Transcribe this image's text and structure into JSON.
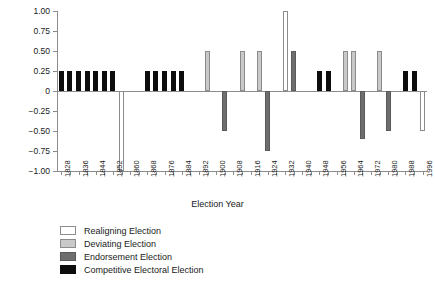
{
  "chart_data": {
    "type": "bar",
    "title": "",
    "xlabel": "Election Year",
    "ylabel": "",
    "ylim": [
      -1.0,
      1.0
    ],
    "xlim": [
      1826,
      1998
    ],
    "grid": false,
    "legend_position": "below-left",
    "ytick_labels": [
      "1.00",
      "0.75",
      "0.50",
      "0.25",
      "0",
      "−0.25",
      "−0.50",
      "−0.75",
      "−1.00"
    ],
    "ytick_values": [
      1.0,
      0.75,
      0.5,
      0.25,
      0,
      -0.25,
      -0.5,
      -0.75,
      -1.0
    ],
    "xtick_values": [
      1828,
      1832,
      1836,
      1840,
      1844,
      1848,
      1852,
      1856,
      1860,
      1864,
      1868,
      1872,
      1876,
      1880,
      1884,
      1888,
      1892,
      1896,
      1900,
      1904,
      1908,
      1912,
      1916,
      1920,
      1924,
      1928,
      1932,
      1936,
      1940,
      1944,
      1948,
      1952,
      1956,
      1960,
      1964,
      1968,
      1972,
      1976,
      1980,
      1984,
      1988,
      1992,
      1996
    ],
    "xtick_labels": [
      "1828",
      "",
      "1836",
      "",
      "1844",
      "",
      "1852",
      "",
      "1860",
      "",
      "1868",
      "",
      "1876",
      "",
      "1884",
      "",
      "1892",
      "",
      "1900",
      "",
      "1908",
      "",
      "1916",
      "",
      "1924",
      "",
      "1932",
      "",
      "1940",
      "",
      "1948",
      "",
      "1956",
      "",
      "1964",
      "",
      "1972",
      "",
      "1980",
      "",
      "1988",
      "",
      "1996"
    ],
    "categories": [
      1828,
      1832,
      1836,
      1840,
      1844,
      1848,
      1852,
      1856,
      1860,
      1864,
      1868,
      1872,
      1876,
      1880,
      1884,
      1888,
      1892,
      1896,
      1900,
      1904,
      1908,
      1912,
      1916,
      1920,
      1924,
      1928,
      1932,
      1936,
      1940,
      1944,
      1948,
      1952,
      1956,
      1960,
      1964,
      1968,
      1972,
      1976,
      1980,
      1984,
      1988,
      1992,
      1996
    ],
    "series": [
      {
        "name": "Election classification",
        "points": [
          {
            "x": 1828,
            "y": 0.25,
            "class": "competitive"
          },
          {
            "x": 1832,
            "y": 0.25,
            "class": "competitive"
          },
          {
            "x": 1836,
            "y": 0.25,
            "class": "competitive"
          },
          {
            "x": 1840,
            "y": 0.25,
            "class": "competitive"
          },
          {
            "x": 1844,
            "y": 0.25,
            "class": "competitive"
          },
          {
            "x": 1848,
            "y": 0.25,
            "class": "competitive"
          },
          {
            "x": 1852,
            "y": 0.25,
            "class": "competitive"
          },
          {
            "x": 1856,
            "y": -1.0,
            "class": "realigning"
          },
          {
            "x": 1868,
            "y": 0.25,
            "class": "competitive"
          },
          {
            "x": 1872,
            "y": 0.25,
            "class": "competitive"
          },
          {
            "x": 1876,
            "y": 0.25,
            "class": "competitive"
          },
          {
            "x": 1880,
            "y": 0.25,
            "class": "competitive"
          },
          {
            "x": 1884,
            "y": 0.25,
            "class": "competitive"
          },
          {
            "x": 1896,
            "y": 0.5,
            "class": "deviating"
          },
          {
            "x": 1904,
            "y": -0.5,
            "class": "endorsement"
          },
          {
            "x": 1912,
            "y": 0.5,
            "class": "deviating"
          },
          {
            "x": 1920,
            "y": 0.5,
            "class": "deviating"
          },
          {
            "x": 1924,
            "y": -0.75,
            "class": "endorsement"
          },
          {
            "x": 1932,
            "y": 1.0,
            "class": "realigning"
          },
          {
            "x": 1936,
            "y": 0.5,
            "class": "endorsement"
          },
          {
            "x": 1948,
            "y": 0.25,
            "class": "competitive"
          },
          {
            "x": 1952,
            "y": 0.25,
            "class": "competitive"
          },
          {
            "x": 1960,
            "y": 0.5,
            "class": "deviating"
          },
          {
            "x": 1964,
            "y": 0.5,
            "class": "deviating"
          },
          {
            "x": 1968,
            "y": -0.6,
            "class": "endorsement"
          },
          {
            "x": 1976,
            "y": 0.5,
            "class": "deviating"
          },
          {
            "x": 1980,
            "y": -0.5,
            "class": "endorsement"
          },
          {
            "x": 1988,
            "y": 0.25,
            "class": "competitive"
          },
          {
            "x": 1992,
            "y": 0.25,
            "class": "competitive"
          },
          {
            "x": 1996,
            "y": -0.5,
            "class": "realigning"
          }
        ]
      }
    ],
    "legend": [
      {
        "key": "realigning",
        "label": "Realigning Election",
        "color": "#ffffff"
      },
      {
        "key": "deviating",
        "label": "Deviating Election",
        "color": "#c9c9c9"
      },
      {
        "key": "endorsement",
        "label": "Endorsement Election",
        "color": "#6e6e6e"
      },
      {
        "key": "competitive",
        "label": "Competitive Electoral Election",
        "color": "#0d0d0d"
      }
    ]
  }
}
